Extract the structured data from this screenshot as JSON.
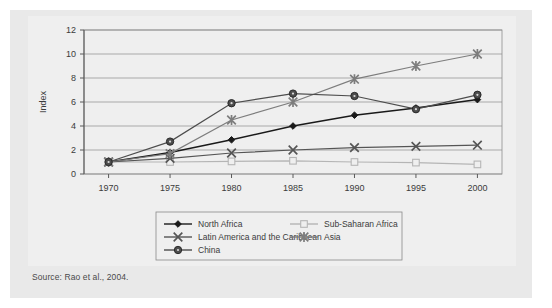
{
  "figure": {
    "source_note": "Source:  Rao et al., 2004.",
    "top_cropped_title": ""
  },
  "chart_data": {
    "type": "line",
    "title": "",
    "xlabel": "",
    "ylabel": "Index",
    "x": [
      1970,
      1975,
      1980,
      1985,
      1990,
      1995,
      2000
    ],
    "categories": [
      "1970",
      "1975",
      "1980",
      "1985",
      "1990",
      "1995",
      "2000"
    ],
    "xlim": [
      1968,
      2002
    ],
    "ylim": [
      0,
      12
    ],
    "yticks": [
      0,
      2,
      4,
      6,
      8,
      10,
      12
    ],
    "ytick_labels": [
      "0",
      "2",
      "4",
      "6",
      "8",
      "10",
      "12"
    ],
    "grid": "horizontal",
    "legend_position": "bottom",
    "series": [
      {
        "name": "North Africa",
        "marker": "diamond",
        "color": "#1a1a1a",
        "values": [
          1.0,
          1.8,
          2.85,
          4.0,
          4.9,
          5.5,
          6.2
        ]
      },
      {
        "name": "Sub-Saharan Africa",
        "marker": "square",
        "color": "#b5b5b5",
        "values": [
          1.0,
          1.0,
          1.05,
          1.1,
          1.0,
          0.95,
          0.8
        ]
      },
      {
        "name": "Latin America and the Caribbean",
        "marker": "x",
        "color": "#555555",
        "values": [
          1.0,
          1.3,
          1.75,
          2.0,
          2.2,
          2.3,
          2.4
        ]
      },
      {
        "name": "Asia",
        "marker": "star",
        "color": "#7d7d7d",
        "values": [
          1.0,
          1.7,
          4.5,
          6.0,
          7.9,
          9.0,
          10.0
        ]
      },
      {
        "name": "China",
        "marker": "circle",
        "color": "#4d4d4d",
        "values": [
          1.0,
          2.7,
          5.9,
          6.7,
          6.5,
          5.4,
          6.6
        ]
      }
    ],
    "legend_layout": [
      [
        "North Africa",
        "Sub-Saharan Africa"
      ],
      [
        "Latin America and the Caribbean",
        "Asia"
      ],
      [
        "China",
        null
      ]
    ]
  }
}
